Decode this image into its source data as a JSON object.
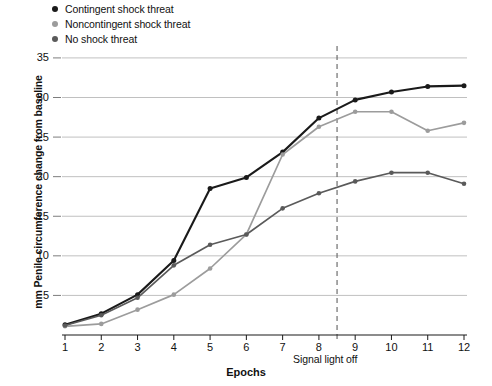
{
  "legend": {
    "items": [
      {
        "label": "Contingent shock threat",
        "color": "#1a1a1a",
        "marker": "legend-dot-contingent"
      },
      {
        "label": "Noncontingent shock threat",
        "color": "#9c9c9c",
        "marker": "legend-dot-noncontingent"
      },
      {
        "label": "No shock threat",
        "color": "#5a5a5a",
        "marker": "legend-dot-no-shock"
      }
    ]
  },
  "annotations": {
    "signal_light_off": "Signal light off"
  },
  "caption": "",
  "chart_data": {
    "type": "line",
    "title": "",
    "xlabel": "Epochs",
    "ylabel": "mm Penile circumference change from baseline",
    "x": [
      1,
      2,
      3,
      4,
      5,
      6,
      7,
      8,
      9,
      10,
      11,
      12
    ],
    "xticklabels": [
      "1",
      "2",
      "3",
      "4",
      "5",
      "6",
      "7",
      "8",
      "9",
      "10",
      "11",
      "12"
    ],
    "yticks": [
      5,
      10,
      15,
      20,
      25,
      30,
      35
    ],
    "yticklabels": [
      "5",
      "10",
      "15",
      "20",
      "25",
      "30",
      "35"
    ],
    "xlim": [
      1,
      12
    ],
    "ylim": [
      0,
      36
    ],
    "grid": "horizontal",
    "legend_position": "top-left-outside",
    "markers": "filled-circle",
    "vline": {
      "x": 8.5,
      "style": "dashed",
      "color": "#6e6e6e",
      "label": "Signal light off"
    },
    "series": [
      {
        "name": "Contingent shock threat",
        "color": "#1a1a1a",
        "values": [
          1.3,
          2.7,
          5.1,
          9.4,
          18.5,
          19.9,
          23.1,
          27.4,
          29.7,
          30.7,
          31.4,
          31.5
        ]
      },
      {
        "name": "Noncontingent shock threat",
        "color": "#9c9c9c",
        "values": [
          1.1,
          1.4,
          3.2,
          5.1,
          8.4,
          12.7,
          22.8,
          26.3,
          28.2,
          28.2,
          25.8,
          26.8
        ]
      },
      {
        "name": "No shock threat",
        "color": "#5a5a5a",
        "values": [
          1.2,
          2.5,
          4.7,
          8.8,
          11.4,
          12.7,
          16.0,
          17.9,
          19.4,
          20.5,
          20.5,
          19.1
        ]
      }
    ]
  }
}
